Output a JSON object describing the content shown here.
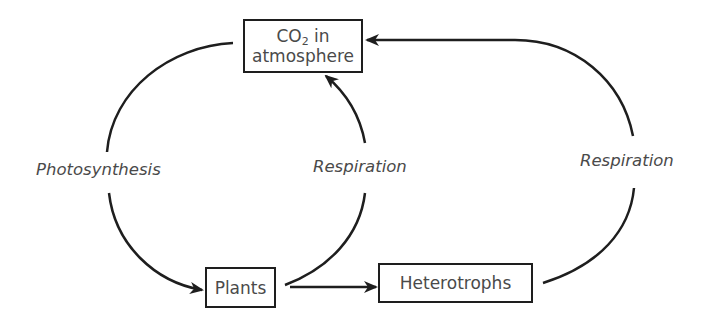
{
  "diagram": {
    "type": "carbon-cycle",
    "nodes": {
      "co2": {
        "line1_prefix": "CO",
        "line1_sub": "2",
        "line1_suffix": " in",
        "line2": "atmosphere"
      },
      "plants": {
        "label": "Plants"
      },
      "heterotrophs": {
        "label": "Heterotrophs"
      }
    },
    "edges": [
      {
        "from": "co2",
        "to": "plants",
        "label": "Photosynthesis"
      },
      {
        "from": "plants",
        "to": "co2",
        "label": "Respiration"
      },
      {
        "from": "plants",
        "to": "heterotrophs",
        "label": ""
      },
      {
        "from": "heterotrophs",
        "to": "co2",
        "label": "Respiration"
      }
    ],
    "labels": {
      "photosynthesis": "Photosynthesis",
      "respiration_plants": "Respiration",
      "respiration_heterotrophs": "Respiration"
    },
    "colors": {
      "stroke": "#1e1e1e",
      "text": "#4a4a4a",
      "background": "#ffffff"
    }
  }
}
